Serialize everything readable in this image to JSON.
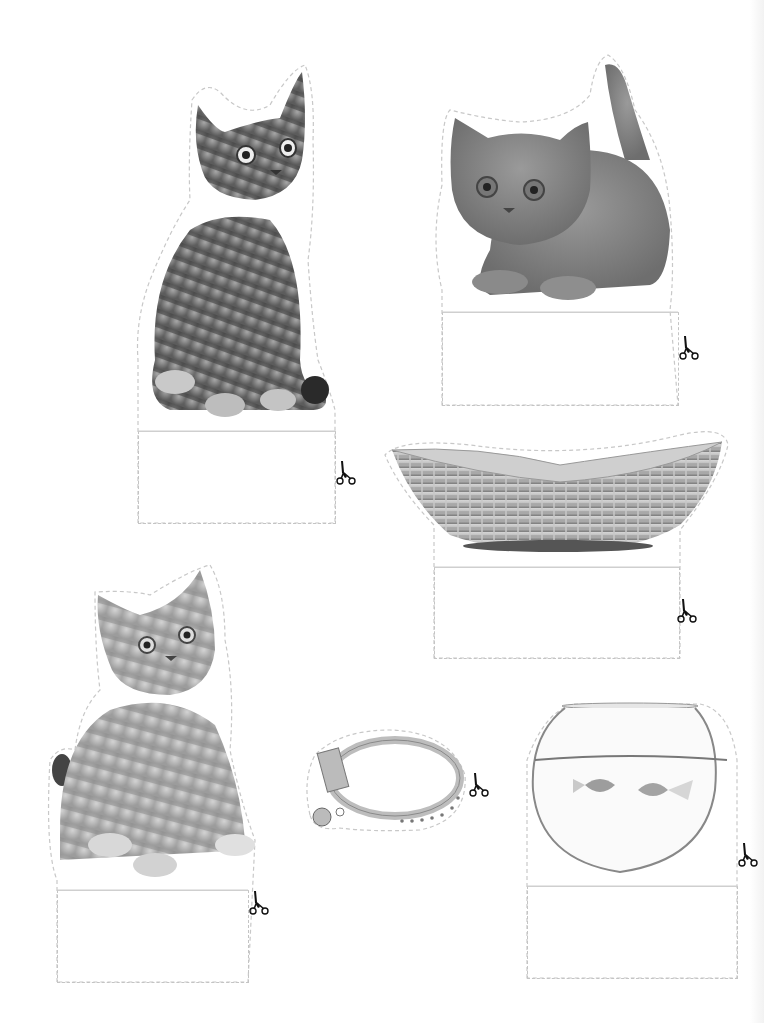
{
  "page": {
    "title": "",
    "background": "#ffffff",
    "cut_line_color": "#c4c4c4"
  },
  "cards": [
    {
      "id": "tabby-kitten-sitting",
      "subject": "tabby kitten sitting",
      "label": "",
      "icon": "scissors-icon"
    },
    {
      "id": "grey-kitten-crouching",
      "subject": "grey british shorthair kitten crouching",
      "label": "",
      "icon": "scissors-icon"
    },
    {
      "id": "wicker-basket",
      "subject": "wicker basket",
      "label": "",
      "icon": "scissors-icon"
    },
    {
      "id": "striped-kitten-sitting",
      "subject": "striped kitten sitting",
      "label": "",
      "icon": "scissors-icon"
    },
    {
      "id": "cat-collar",
      "subject": "cat collar with bell",
      "label": "",
      "icon": "scissors-icon"
    },
    {
      "id": "goldfish-bowl",
      "subject": "fish bowl with two goldfish",
      "label": "",
      "icon": "scissors-icon"
    }
  ]
}
